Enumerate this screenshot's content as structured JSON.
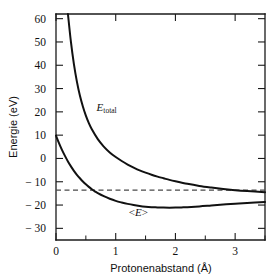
{
  "chart_data": {
    "type": "line",
    "title": "",
    "xlabel": "Protonenabstand (Å)",
    "ylabel": "Energie (eV)",
    "xlim": [
      0,
      3.5
    ],
    "ylim": [
      -35,
      62
    ],
    "grid": false,
    "legend": "inline-annotations",
    "xticks": [
      0,
      1,
      2,
      3
    ],
    "xticklabels": [
      "0",
      "1",
      "2",
      "3"
    ],
    "xminorticks": [
      0.5,
      1.5,
      2.5,
      3.5
    ],
    "yticks": [
      60,
      50,
      40,
      30,
      20,
      10,
      0,
      -10,
      -20,
      -30
    ],
    "yticklabels": [
      "60",
      "50",
      "40",
      "30",
      "20",
      "10",
      "0",
      "− 10",
      "− 20",
      "− 30"
    ],
    "annotations": [
      {
        "name": "e-total-label",
        "text": "E",
        "subscript": "total",
        "x": 0.68,
        "y": 20.5
      },
      {
        "name": "e-expect-label",
        "text": "<E>",
        "x": 1.22,
        "y": -24.5
      }
    ],
    "reference_line": {
      "name": "hydrogen-ground-state",
      "orientation": "horizontal",
      "y": -13.6,
      "style": "dashed"
    },
    "series": [
      {
        "name": "E_total",
        "label": "E_total",
        "style": "solid",
        "x": [
          0.2,
          0.25,
          0.3,
          0.35,
          0.4,
          0.45,
          0.5,
          0.55,
          0.6,
          0.7,
          0.8,
          0.9,
          1.0,
          1.1,
          1.2,
          1.3,
          1.4,
          1.5,
          1.6,
          1.7,
          1.8,
          1.9,
          2.0,
          2.2,
          2.4,
          2.6,
          2.8,
          3.0,
          3.2,
          3.5
        ],
        "values": [
          62.0,
          50.0,
          40.5,
          33.0,
          27.0,
          22.3,
          18.4,
          15.2,
          12.5,
          8.3,
          5.1,
          2.6,
          0.6,
          -1.1,
          -2.6,
          -3.9,
          -5.1,
          -6.1,
          -7.0,
          -7.8,
          -8.5,
          -9.2,
          -9.8,
          -10.9,
          -11.8,
          -12.5,
          -13.1,
          -13.6,
          -14.0,
          -14.5
        ]
      },
      {
        "name": "E_expectation",
        "label": "<E>",
        "style": "solid",
        "x": [
          0.0,
          0.05,
          0.1,
          0.15,
          0.2,
          0.25,
          0.3,
          0.35,
          0.4,
          0.45,
          0.5,
          0.55,
          0.6,
          0.65,
          0.7,
          0.8,
          0.9,
          1.0,
          1.1,
          1.2,
          1.3,
          1.4,
          1.5,
          1.6,
          1.7,
          1.8,
          1.9,
          2.0,
          2.1,
          2.2,
          2.4,
          2.6,
          2.8,
          3.0,
          3.2,
          3.5
        ],
        "values": [
          9.8,
          6.6,
          3.7,
          1.1,
          -1.3,
          -3.4,
          -5.3,
          -7.0,
          -8.5,
          -9.9,
          -11.1,
          -12.2,
          -13.2,
          -14.1,
          -14.9,
          -16.2,
          -17.3,
          -18.2,
          -18.9,
          -19.5,
          -20.0,
          -20.4,
          -20.7,
          -20.9,
          -21.0,
          -21.1,
          -21.15,
          -21.1,
          -21.0,
          -20.9,
          -20.6,
          -20.2,
          -19.8,
          -19.4,
          -19.1,
          -18.7
        ]
      }
    ]
  }
}
